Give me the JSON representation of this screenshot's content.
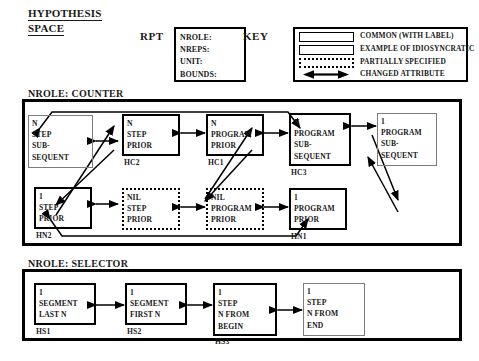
{
  "title": {
    "line1": "HYPOTHESIS",
    "line2": "SPACE"
  },
  "rpt": {
    "label": "RPT",
    "fields": [
      {
        "name": "nrole",
        "text": "NROLE:"
      },
      {
        "name": "nreps",
        "text": "NREPS:"
      },
      {
        "name": "unit",
        "text": "UNIT:"
      },
      {
        "name": "bounds",
        "text": "BOUNDS:"
      }
    ]
  },
  "key": {
    "label": "KEY",
    "entries": [
      {
        "symbol": "solid-rectangle",
        "text": "COMMON  (WITH LABEL)"
      },
      {
        "symbol": "thin-rectangle",
        "text": "EXAMPLE OF IDIOSYNCRATIC"
      },
      {
        "symbol": "dotted-rectangle",
        "text": "PARTIALLY  SPECIFIED"
      },
      {
        "symbol": "double-arrow",
        "text": "CHANGED  ATTRIBUTE"
      }
    ]
  },
  "sections": [
    {
      "name": "counter",
      "label": "NROLE:  COUNTER",
      "nodes": [
        {
          "id": "c1",
          "style": "idio",
          "lines": [
            "N",
            "STEP",
            "SUB-",
            "SEQUENT"
          ],
          "label": ""
        },
        {
          "id": "HC2",
          "style": "common",
          "lines": [
            "N",
            "STEP",
            "PRIOR"
          ],
          "label": "HC2"
        },
        {
          "id": "HC1",
          "style": "common",
          "lines": [
            "N",
            "PROGRAM",
            "PRIOR"
          ],
          "label": "HC1"
        },
        {
          "id": "HC3",
          "style": "common",
          "lines": [
            "N",
            "PROGRAM",
            "SUB-",
            "SEQUENT"
          ],
          "label": "HC3"
        },
        {
          "id": "c5",
          "style": "idio",
          "lines": [
            "1",
            "PROGRAM",
            "SUB-",
            "SEQUENT"
          ],
          "label": ""
        },
        {
          "id": "HN2",
          "style": "common",
          "lines": [
            "1",
            "STEP",
            "PRIOR"
          ],
          "label": "HN2"
        },
        {
          "id": "n2",
          "style": "partial",
          "lines": [
            "NIL",
            "STEP",
            "PRIOR"
          ],
          "label": ""
        },
        {
          "id": "n3",
          "style": "partial",
          "lines": [
            "NIL",
            "PROGRAM",
            "PRIOR"
          ],
          "label": ""
        },
        {
          "id": "HN1",
          "style": "common",
          "lines": [
            "1",
            "PROGRAM",
            "PRIOR"
          ],
          "label": "HN1"
        }
      ]
    },
    {
      "name": "selector",
      "label": "NROLE:  SELECTOR",
      "nodes": [
        {
          "id": "HS1",
          "style": "common",
          "lines": [
            "1",
            "SEGMENT",
            "LAST  N"
          ],
          "label": "HS1"
        },
        {
          "id": "HS2",
          "style": "common",
          "lines": [
            "1",
            "SEGMENT",
            "FIRST  N"
          ],
          "label": "HS2"
        },
        {
          "id": "HS3",
          "style": "common",
          "lines": [
            "1",
            "STEP",
            "N  FROM",
            "BEGIN"
          ],
          "label": "HS3"
        },
        {
          "id": "s4",
          "style": "idio",
          "lines": [
            "1",
            "STEP",
            "N  FROM",
            "END"
          ],
          "label": ""
        }
      ]
    }
  ],
  "colors": {
    "ink": "#1a1a1a",
    "line": "#000000",
    "idiosyncratic_border": "#7d7d7d"
  }
}
